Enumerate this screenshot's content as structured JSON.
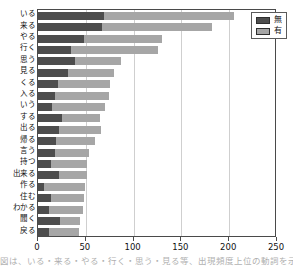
{
  "chart_data": {
    "type": "bar",
    "orientation": "horizontal",
    "stacked": true,
    "title": "",
    "xlabel": "",
    "ylabel": "",
    "xlim": [
      0,
      250
    ],
    "xticks": [
      0,
      50,
      100,
      150,
      200,
      250
    ],
    "grid": true,
    "legend_position": "top-right",
    "categories": [
      "いる",
      "来る",
      "やる",
      "行く",
      "思う",
      "見る",
      "くる",
      "入る",
      "いう",
      "する",
      "出る",
      "帰る",
      "言う",
      "持つ",
      "出来る",
      "作る",
      "住む",
      "わかる",
      "聞く",
      "戻る"
    ],
    "series": [
      {
        "name": "無",
        "color": "#4d4d4d",
        "values": [
          69,
          67,
          48,
          34,
          39,
          31,
          21,
          18,
          15,
          25,
          22,
          19,
          18,
          14,
          22,
          6,
          14,
          12,
          23,
          11
        ]
      },
      {
        "name": "有",
        "color": "#a6a6a6",
        "values": [
          136,
          115,
          82,
          92,
          48,
          49,
          54,
          56,
          55,
          40,
          44,
          41,
          35,
          37,
          29,
          43,
          34,
          35,
          21,
          32
        ]
      }
    ],
    "totals": [
      205,
      182,
      130,
      126,
      87,
      80,
      75,
      74,
      70,
      65,
      66,
      60,
      53,
      51,
      51,
      49,
      48,
      47,
      44,
      43
    ]
  },
  "legend": {
    "items": [
      {
        "label": "無",
        "color": "#4d4d4d"
      },
      {
        "label": "有",
        "color": "#a6a6a6"
      }
    ]
  },
  "caption": {
    "text": "図は、いる・来る・やる・行く・思う・見る等、出現頻度上位の動詞を示す"
  }
}
